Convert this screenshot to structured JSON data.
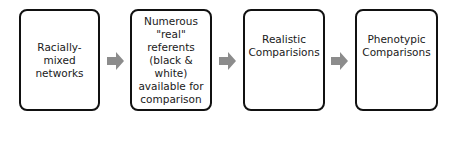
{
  "diagram": {
    "type": "flowchart",
    "direction": "left-to-right",
    "colors": {
      "box_border": "#111111",
      "box_fill": "#ffffff",
      "text": "#1a1a1a",
      "arrow": "#8c8c8c"
    },
    "nodes": [
      {
        "id": "racially-mixed-networks",
        "label": "Racially-mixed\nnetworks"
      },
      {
        "id": "numerous-real-referents",
        "label": "Numerous\n\"real\"\nreferents\n(black &\nwhite)\navailable for\ncomparison"
      },
      {
        "id": "realistic-comparisions",
        "label": "Realistic\nComparisions"
      },
      {
        "id": "phenotypic-comparisons",
        "label": "Phenotypic\nComparisons"
      }
    ],
    "edges": [
      {
        "from": "racially-mixed-networks",
        "to": "numerous-real-referents",
        "icon": "arrow-right-icon"
      },
      {
        "from": "numerous-real-referents",
        "to": "realistic-comparisions",
        "icon": "arrow-right-icon"
      },
      {
        "from": "realistic-comparisions",
        "to": "phenotypic-comparisons",
        "icon": "arrow-right-icon"
      }
    ]
  }
}
